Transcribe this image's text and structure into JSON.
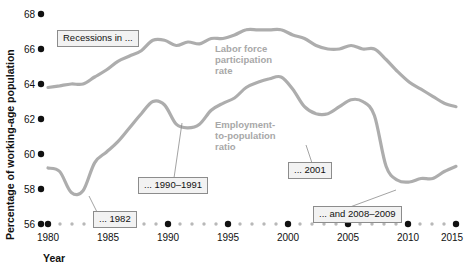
{
  "axes": {
    "y_title": "Percentage of working-age population",
    "x_title": "Year",
    "y_ticks": [
      "68",
      "66",
      "64",
      "62",
      "60",
      "58",
      "56"
    ],
    "x_ticks": [
      "1980",
      "1985",
      "1990",
      "1995",
      "2000",
      "2005",
      "2010",
      "2015"
    ]
  },
  "series_labels": {
    "lfp_line1": "Labor force",
    "lfp_line2": "participation",
    "lfp_line3": "rate",
    "epr_line1": "Employment-",
    "epr_line2": "to-population",
    "epr_line3": "ratio"
  },
  "callouts": {
    "recessions": "Recessions in ...",
    "r1982": "... 1982",
    "r1990": "... 1990–1991",
    "r2001": "... 2001",
    "r2008": "... and 2008–2009"
  },
  "colors": {
    "line": "#adadad",
    "label": "#a8a8a8",
    "box_fill": "#f2f2f2",
    "box_border": "#8c8c8c",
    "tick_dot": "#111111",
    "minor_dot": "#b8b8b8"
  },
  "chart_data": {
    "type": "line",
    "title": "",
    "xlabel": "Year",
    "ylabel": "Percentage of working-age population",
    "xlim": [
      1980,
      2015
    ],
    "ylim": [
      56,
      68
    ],
    "grid": false,
    "legend": "inline-labels",
    "x": [
      1980,
      1981,
      1982,
      1983,
      1984,
      1985,
      1986,
      1987,
      1988,
      1989,
      1990,
      1991,
      1992,
      1993,
      1994,
      1995,
      1996,
      1997,
      1998,
      1999,
      2000,
      2001,
      2002,
      2003,
      2004,
      2005,
      2006,
      2007,
      2008,
      2009,
      2010,
      2011,
      2012,
      2013,
      2014,
      2015
    ],
    "series": [
      {
        "name": "Labor force participation rate",
        "values": [
          63.8,
          63.9,
          64.0,
          64.0,
          64.4,
          64.8,
          65.3,
          65.6,
          65.9,
          66.5,
          66.5,
          66.2,
          66.4,
          66.3,
          66.6,
          66.6,
          66.8,
          67.1,
          67.1,
          67.1,
          67.1,
          66.8,
          66.6,
          66.2,
          66.0,
          66.0,
          66.2,
          66.0,
          66.0,
          65.4,
          64.7,
          64.1,
          63.7,
          63.3,
          62.9,
          62.7
        ]
      },
      {
        "name": "Employment-to-population ratio",
        "values": [
          59.2,
          59.0,
          57.8,
          57.9,
          59.5,
          60.1,
          60.7,
          61.5,
          62.3,
          63.0,
          62.8,
          61.7,
          61.5,
          61.7,
          62.5,
          62.9,
          63.2,
          63.8,
          64.1,
          64.3,
          64.4,
          63.7,
          62.7,
          62.3,
          62.3,
          62.7,
          63.1,
          63.0,
          62.2,
          59.3,
          58.5,
          58.4,
          58.6,
          58.6,
          59.0,
          59.3
        ]
      }
    ],
    "annotations": [
      {
        "text": "Recessions in ...",
        "x": 1983,
        "y": 67.0
      },
      {
        "text": "... 1982",
        "x": 1984,
        "y": 56.6
      },
      {
        "text": "... 1990–1991",
        "x": 1990.5,
        "y": 58.2
      },
      {
        "text": "... 2001",
        "x": 2002,
        "y": 59.6
      },
      {
        "text": "... and 2008–2009",
        "x": 2009,
        "y": 57.3
      }
    ]
  }
}
